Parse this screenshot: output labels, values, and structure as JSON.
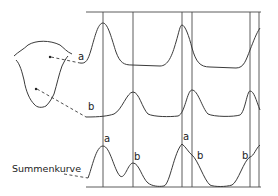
{
  "figure": {
    "labels": {
      "curve_a": "a",
      "curve_b": "b",
      "sum_curve": "Summenkurve",
      "sum_peak_a1": "a",
      "sum_peak_b1": "b",
      "sum_peak_a2": "a",
      "sum_peak_b2": "b",
      "sum_peak_b3": "b"
    },
    "colors": {
      "line": "#3a3a3a",
      "background": "#ffffff"
    }
  }
}
